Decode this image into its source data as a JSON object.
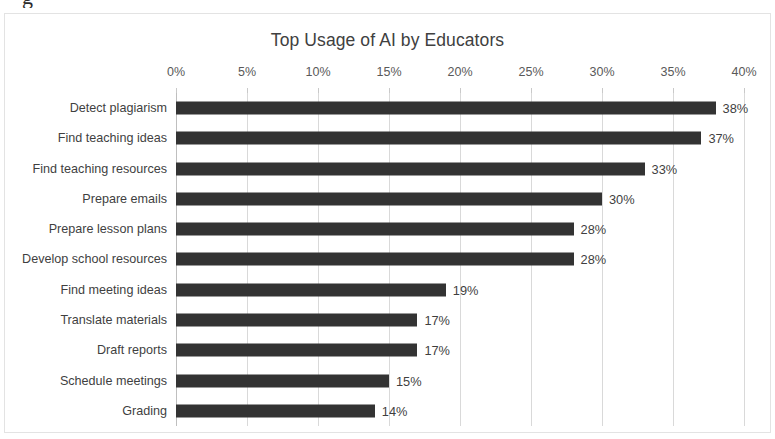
{
  "stray_glyph": "g",
  "chart_data": {
    "type": "bar",
    "orientation": "horizontal",
    "title": "Top Usage of AI by Educators",
    "xlabel": "",
    "ylabel": "",
    "xlim": [
      0,
      40
    ],
    "xticks": [
      0,
      5,
      10,
      15,
      20,
      25,
      30,
      35,
      40
    ],
    "xtick_labels": [
      "0%",
      "5%",
      "10%",
      "15%",
      "20%",
      "25%",
      "30%",
      "35%",
      "40%"
    ],
    "grid": true,
    "legend": false,
    "bar_color": "#333333",
    "gridline_color": "#d9d9d9",
    "text_color": "#3f3f3f",
    "categories": [
      "Detect plagiarism",
      "Find teaching ideas",
      "Find teaching resources",
      "Prepare emails",
      "Prepare lesson plans",
      "Develop school resources",
      "Find meeting ideas",
      "Translate materials",
      "Draft reports",
      "Schedule meetings",
      "Grading"
    ],
    "values": [
      38,
      37,
      33,
      30,
      28,
      28,
      19,
      17,
      17,
      15,
      14
    ],
    "value_labels": [
      "38%",
      "37%",
      "33%",
      "30%",
      "28%",
      "28%",
      "19%",
      "17%",
      "17%",
      "15%",
      "14%"
    ]
  }
}
